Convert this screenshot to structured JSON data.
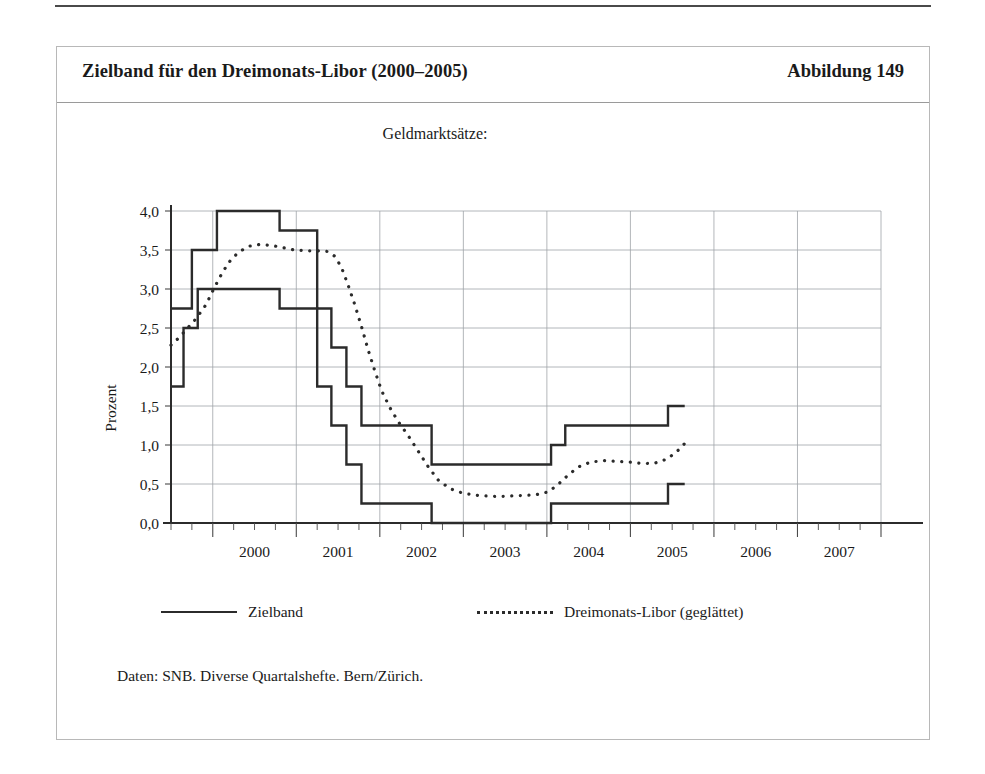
{
  "figure": {
    "title": "Zielband für den Dreimonats-Libor (2000–2005)",
    "number_label": "Abbildung 149",
    "subtitle": "Geldmarktsätze:",
    "source_note": "Daten: SNB. Diverse Quartalshefte. Bern/Zürich.",
    "y_axis_title": "Prozent"
  },
  "legend": {
    "items": [
      {
        "label": "Zielband",
        "style": "solid",
        "color": "#2b2b2b"
      },
      {
        "label": "Dreimonats-Libor (geglättet)",
        "style": "dotted",
        "color": "#2b2b2b"
      }
    ]
  },
  "chart_data": {
    "type": "line",
    "title": "Zielband für den Dreimonats-Libor (2000–2005)",
    "subtitle": "Geldmarktsätze:",
    "xlabel": "",
    "ylabel": "Prozent",
    "xlim": [
      1999.5,
      2008.0
    ],
    "ylim": [
      0.0,
      4.0
    ],
    "grid": true,
    "legend_position": "bottom",
    "x_tick_labels": [
      "2000",
      "2001",
      "2002",
      "2003",
      "2004",
      "2005",
      "2006",
      "2007"
    ],
    "x_tick_values": [
      2000.5,
      2001.5,
      2002.5,
      2003.5,
      2004.5,
      2005.5,
      2006.5,
      2007.5
    ],
    "x_gridlines": [
      2000.0,
      2001.0,
      2002.0,
      2003.0,
      2004.0,
      2005.0,
      2006.0,
      2007.0,
      2008.0
    ],
    "x_minor_ticks_per_year": 4,
    "y_tick_labels": [
      "0,0",
      "0,5",
      "1,0",
      "1,5",
      "2,0",
      "2,5",
      "3,0",
      "3,5",
      "4,0"
    ],
    "y_tick_values": [
      0.0,
      0.5,
      1.0,
      1.5,
      2.0,
      2.5,
      3.0,
      3.5,
      4.0
    ],
    "series": [
      {
        "name": "Zielband (obere Grenze)",
        "style": "step-solid",
        "color": "#2b2b2b",
        "points": [
          [
            1999.5,
            2.75
          ],
          [
            1999.75,
            2.75
          ],
          [
            1999.75,
            3.5
          ],
          [
            2000.05,
            3.5
          ],
          [
            2000.05,
            4.0
          ],
          [
            2000.8,
            4.0
          ],
          [
            2000.8,
            3.75
          ],
          [
            2001.25,
            3.75
          ],
          [
            2001.25,
            2.75
          ],
          [
            2001.42,
            2.75
          ],
          [
            2001.42,
            2.25
          ],
          [
            2001.6,
            2.25
          ],
          [
            2001.6,
            1.75
          ],
          [
            2001.78,
            1.75
          ],
          [
            2001.78,
            1.25
          ],
          [
            2002.62,
            1.25
          ],
          [
            2002.62,
            0.75
          ],
          [
            2004.05,
            0.75
          ],
          [
            2004.05,
            1.0
          ],
          [
            2004.22,
            1.0
          ],
          [
            2004.22,
            1.25
          ],
          [
            2005.45,
            1.25
          ],
          [
            2005.45,
            1.5
          ],
          [
            2005.65,
            1.5
          ]
        ]
      },
      {
        "name": "Zielband (untere Grenze)",
        "style": "step-solid",
        "color": "#2b2b2b",
        "points": [
          [
            1999.5,
            1.75
          ],
          [
            1999.65,
            1.75
          ],
          [
            1999.65,
            2.5
          ],
          [
            1999.82,
            2.5
          ],
          [
            1999.82,
            3.0
          ],
          [
            2000.8,
            3.0
          ],
          [
            2000.8,
            2.75
          ],
          [
            2001.25,
            2.75
          ],
          [
            2001.25,
            1.75
          ],
          [
            2001.42,
            1.75
          ],
          [
            2001.42,
            1.25
          ],
          [
            2001.6,
            1.25
          ],
          [
            2001.6,
            0.75
          ],
          [
            2001.78,
            0.75
          ],
          [
            2001.78,
            0.25
          ],
          [
            2002.62,
            0.25
          ],
          [
            2002.62,
            0.0
          ],
          [
            2004.05,
            0.0
          ],
          [
            2004.05,
            0.25
          ],
          [
            2005.45,
            0.25
          ],
          [
            2005.45,
            0.5
          ],
          [
            2005.65,
            0.5
          ]
        ]
      },
      {
        "name": "Dreimonats-Libor (geglättet)",
        "style": "dotted",
        "color": "#2b2b2b",
        "points": [
          [
            1999.5,
            2.28
          ],
          [
            1999.6,
            2.38
          ],
          [
            1999.7,
            2.5
          ],
          [
            1999.8,
            2.62
          ],
          [
            1999.92,
            2.8
          ],
          [
            2000.02,
            3.02
          ],
          [
            2000.12,
            3.22
          ],
          [
            2000.22,
            3.38
          ],
          [
            2000.32,
            3.48
          ],
          [
            2000.44,
            3.55
          ],
          [
            2000.56,
            3.57
          ],
          [
            2000.7,
            3.56
          ],
          [
            2000.84,
            3.53
          ],
          [
            2000.98,
            3.5
          ],
          [
            2001.12,
            3.49
          ],
          [
            2001.26,
            3.49
          ],
          [
            2001.38,
            3.48
          ],
          [
            2001.46,
            3.42
          ],
          [
            2001.54,
            3.28
          ],
          [
            2001.62,
            3.05
          ],
          [
            2001.7,
            2.8
          ],
          [
            2001.78,
            2.52
          ],
          [
            2001.86,
            2.22
          ],
          [
            2001.94,
            1.95
          ],
          [
            2002.02,
            1.7
          ],
          [
            2002.12,
            1.48
          ],
          [
            2002.22,
            1.3
          ],
          [
            2002.34,
            1.12
          ],
          [
            2002.46,
            0.92
          ],
          [
            2002.58,
            0.72
          ],
          [
            2002.7,
            0.55
          ],
          [
            2002.84,
            0.44
          ],
          [
            2003.0,
            0.38
          ],
          [
            2003.2,
            0.35
          ],
          [
            2003.42,
            0.34
          ],
          [
            2003.64,
            0.35
          ],
          [
            2003.86,
            0.36
          ],
          [
            2004.02,
            0.4
          ],
          [
            2004.14,
            0.5
          ],
          [
            2004.26,
            0.62
          ],
          [
            2004.38,
            0.72
          ],
          [
            2004.52,
            0.78
          ],
          [
            2004.68,
            0.8
          ],
          [
            2004.84,
            0.79
          ],
          [
            2005.0,
            0.78
          ],
          [
            2005.16,
            0.76
          ],
          [
            2005.3,
            0.77
          ],
          [
            2005.44,
            0.82
          ],
          [
            2005.56,
            0.92
          ],
          [
            2005.66,
            1.03
          ]
        ]
      }
    ]
  }
}
